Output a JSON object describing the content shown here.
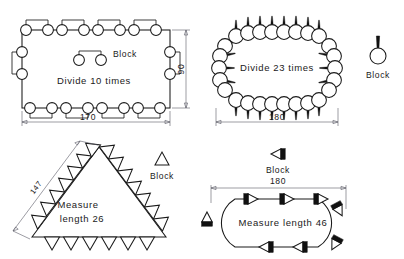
{
  "sheet": {
    "top_partial_text": "",
    "background": "#ffffff",
    "ink": "#1a1a1a",
    "dim_color": "#5a5a66"
  },
  "panels": [
    {
      "id": "rect-divide-10",
      "title_text": "Divide 10 times",
      "legend_label": "Block",
      "block_shape": "two-circles-with-staple",
      "dimensions": [
        {
          "name": "width",
          "value": "170",
          "orientation": "horizontal"
        },
        {
          "name": "height",
          "value": "90",
          "orientation": "vertical"
        }
      ],
      "divide_count": 10,
      "path_shape": "rectangle"
    },
    {
      "id": "oval-divide-23",
      "title_text": "Divide 23 times",
      "legend_label": "Block",
      "block_shape": "circle-with-spike",
      "dimensions": [
        {
          "name": "width",
          "value": "180",
          "orientation": "horizontal"
        }
      ],
      "divide_count": 23,
      "path_shape": "stadium-oval"
    },
    {
      "id": "triangle-measure-26",
      "title_line1": "Measure",
      "title_line2": "length 26",
      "legend_label": "Block",
      "block_shape": "triangle-outline",
      "dimensions": [
        {
          "name": "side",
          "value": "147",
          "orientation": "diagonal"
        }
      ],
      "measure_length": 26,
      "path_shape": "triangle"
    },
    {
      "id": "stadium-measure-46",
      "title_text": "Measure length 46",
      "legend_label": "Block",
      "block_shape": "arrow-with-solid-bar",
      "dimensions": [
        {
          "name": "width",
          "value": "180",
          "orientation": "horizontal"
        }
      ],
      "measure_length": 46,
      "path_shape": "stadium-oval"
    }
  ]
}
